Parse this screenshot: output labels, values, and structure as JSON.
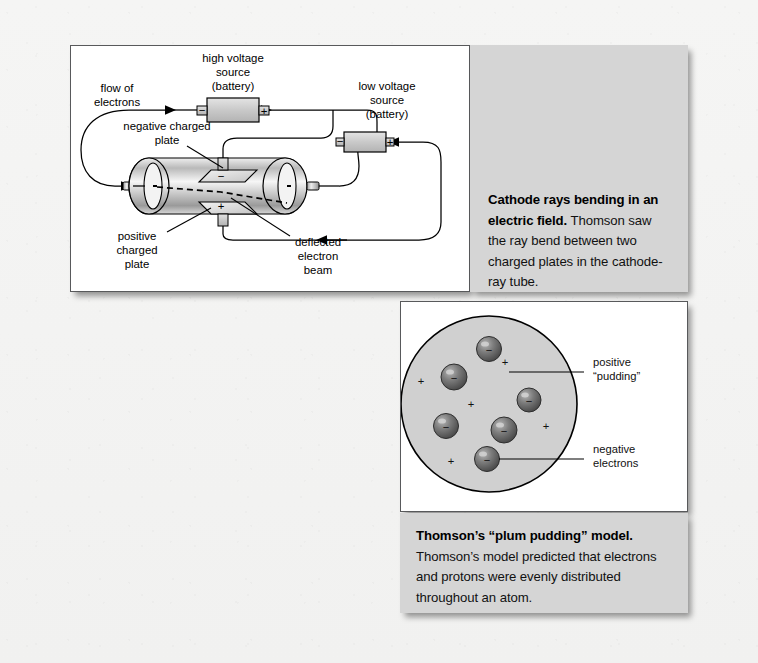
{
  "figure": {
    "tube": {
      "labels": {
        "high_voltage": [
          "high voltage",
          "source",
          "(battery)"
        ],
        "low_voltage": [
          "low voltage",
          "source",
          "(battery)"
        ],
        "flow_of_electrons": [
          "flow of",
          "electrons"
        ],
        "negative_plate": [
          "negative charged",
          "plate"
        ],
        "positive_plate": [
          "positive",
          "charged",
          "plate"
        ],
        "deflected_beam": [
          "deflected",
          "electron",
          "beam"
        ],
        "battery_minus": "−",
        "battery_plus": "+",
        "plate_minus": "−",
        "plate_plus": "+"
      }
    },
    "tube_caption": {
      "bold": "Cathode rays bending in an electric field.",
      "rest": " Thomson saw the ray bend between two charged plates in the cathode-ray tube."
    },
    "atom": {
      "labels": {
        "positive_pudding": [
          "positive",
          "“pudding”"
        ],
        "negative_electrons": [
          "negative",
          "electrons"
        ]
      },
      "electron_sign": "−",
      "proton_sign": "+",
      "electrons": [
        {
          "cx": 88,
          "cy": 47,
          "r": 12.5
        },
        {
          "cx": 53,
          "cy": 75,
          "r": 13.0
        },
        {
          "cx": 128,
          "cy": 98,
          "r": 12.0
        },
        {
          "cx": 45,
          "cy": 124,
          "r": 12.5
        },
        {
          "cx": 103,
          "cy": 128,
          "r": 13.0
        },
        {
          "cx": 86,
          "cy": 157,
          "r": 12.5
        }
      ],
      "protons": [
        {
          "x": 104,
          "y": 64
        },
        {
          "x": 20,
          "y": 83
        },
        {
          "x": 70,
          "y": 106
        },
        {
          "x": 145,
          "y": 128
        },
        {
          "x": 50,
          "y": 163
        }
      ]
    },
    "atom_caption": {
      "bold": "Thomson’s “plum pudding” model.",
      "rest": " Thomson’s model predicted that electrons and protons were evenly distributed throughout an atom."
    }
  },
  "colors": {
    "page_background": "#f4f4f3",
    "panel_background": "#ffffff",
    "caption_background": "#d5d5d5",
    "line": "#000000",
    "border": "#58595b",
    "atom_fill": "#d0d0d0",
    "electron_fill": "#6e6e6e",
    "battery_fill": "#c9c9c9"
  }
}
